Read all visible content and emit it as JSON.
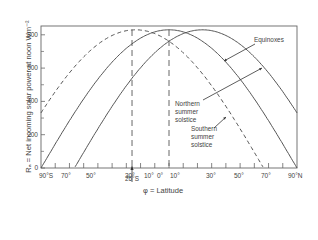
{
  "chart_data": {
    "type": "line",
    "title": "",
    "xlabel": "φ = Latitude",
    "ylabel": "Rₐ = Net incoming solar power at noon Wm⁻²",
    "x_ticks": [
      "90°S",
      "70°",
      "50°",
      "30°",
      "10°",
      "0°",
      "10°",
      "30°",
      "50°",
      "70°",
      "90°N"
    ],
    "x_tick_values": [
      -90,
      -70,
      -50,
      -30,
      -10,
      0,
      10,
      30,
      50,
      70,
      90
    ],
    "y_ticks": [
      "0",
      "200",
      "400",
      "600",
      "800"
    ],
    "y_tick_values": [
      0,
      200,
      400,
      600,
      800
    ],
    "xlim": [
      -90,
      90
    ],
    "ylim": [
      0,
      850
    ],
    "grid": false,
    "legend": "annotated labels with arrows",
    "x": [
      -90,
      -80,
      -70,
      -60,
      -50,
      -40,
      -30,
      -20,
      -10,
      0,
      10,
      20,
      30,
      40,
      50,
      60,
      70,
      80,
      90
    ],
    "series": [
      {
        "name": "Southern summer solstice",
        "style": "dashed",
        "peak_latitude": -23.5,
        "values": [
          330,
          440,
          540,
          630,
          710,
          770,
          810,
          830,
          810,
          770,
          700,
          610,
          510,
          400,
          280,
          150,
          25,
          0,
          0
        ]
      },
      {
        "name": "Equinoxes",
        "style": "solid",
        "peak_latitude": 0,
        "values": [
          0,
          145,
          285,
          415,
          535,
          635,
          720,
          780,
          815,
          830,
          815,
          780,
          720,
          635,
          535,
          415,
          285,
          145,
          0
        ]
      },
      {
        "name": "Northern summer solstice",
        "style": "solid",
        "peak_latitude": 23.5,
        "values": [
          0,
          0,
          25,
          150,
          280,
          400,
          510,
          610,
          700,
          770,
          810,
          830,
          810,
          770,
          710,
          630,
          540,
          440,
          330
        ]
      }
    ],
    "markers": [
      {
        "label": "26°S",
        "x": -26,
        "style": "dashed vertical"
      },
      {
        "label": "",
        "x": 0,
        "style": "dashed vertical"
      }
    ],
    "annotations": [
      {
        "text": "Equinoxes"
      },
      {
        "text": "Northern summer solstice"
      },
      {
        "text": "Southern summer solstice"
      },
      {
        "text": "26°S"
      }
    ]
  },
  "labels": {
    "ylabel": "Rₐ = Net incoming solar power at noon Wm⁻²",
    "xlabel": "φ = Latitude",
    "marker": "26°S",
    "equinoxes": "Equinoxes",
    "northern": [
      "Northern",
      "summer",
      "solstice"
    ],
    "southern": [
      "Southern",
      "summer",
      "solstice"
    ]
  }
}
